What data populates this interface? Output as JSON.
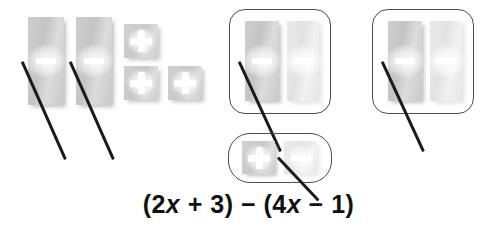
{
  "diagram": {
    "expression": {
      "full_text": "(2x + 3) − (4x − 1)",
      "open_paren_1": "(",
      "coefficient_1": "2",
      "variable_1": "x",
      "operator_1": "+",
      "constant_1": "3",
      "close_paren_1": ")",
      "operator_main": "−",
      "open_paren_2": "(",
      "coefficient_2": "4",
      "variable_2": "x",
      "operator_2": "−",
      "constant_2": "1",
      "close_paren_2": ")"
    },
    "colors": {
      "tile_fill": "#c9c9c9",
      "tile_fill_faint": "#e8e8e8",
      "sign_color": "#ffffff",
      "crossout_color": "#1b1b1b",
      "group_border": "#4d4d4d",
      "text_color": "#111111",
      "background": "#ffffff"
    },
    "loose_tiles": [
      {
        "id": "x-tile-1",
        "kind": "x-tile",
        "sign": "minus",
        "crossed_out": true,
        "faint": false,
        "x": 28,
        "y": 17,
        "w": 36,
        "h": 88
      },
      {
        "id": "x-tile-2",
        "kind": "x-tile",
        "sign": "minus",
        "crossed_out": true,
        "faint": false,
        "x": 76,
        "y": 17,
        "w": 36,
        "h": 88
      },
      {
        "id": "unit-tile-1",
        "kind": "unit-tile",
        "sign": "plus",
        "crossed_out": false,
        "faint": false,
        "x": 124,
        "y": 24,
        "w": 34,
        "h": 34
      },
      {
        "id": "unit-tile-2",
        "kind": "unit-tile",
        "sign": "plus",
        "crossed_out": false,
        "faint": false,
        "x": 124,
        "y": 66,
        "w": 34,
        "h": 34
      },
      {
        "id": "unit-tile-3",
        "kind": "unit-tile",
        "sign": "plus",
        "crossed_out": false,
        "faint": false,
        "x": 168,
        "y": 66,
        "w": 34,
        "h": 34
      }
    ],
    "groups": [
      {
        "id": "zero-pair-group-1",
        "label": "zero-pair-x-tiles-left",
        "x": 229,
        "y": 9,
        "w": 102,
        "h": 105,
        "wide": false,
        "tiles": [
          {
            "id": "g1-x-tile-a",
            "kind": "x-tile",
            "sign": "minus",
            "crossed_out": true,
            "faint": false,
            "x": 16,
            "y": 12,
            "w": 34,
            "h": 80
          },
          {
            "id": "g1-x-tile-b",
            "kind": "x-tile",
            "sign": "minus",
            "crossed_out": false,
            "faint": true,
            "x": 58,
            "y": 12,
            "w": 32,
            "h": 80
          }
        ]
      },
      {
        "id": "zero-pair-group-2",
        "label": "zero-pair-x-tiles-right",
        "x": 372,
        "y": 9,
        "w": 102,
        "h": 105,
        "wide": false,
        "tiles": [
          {
            "id": "g2-x-tile-a",
            "kind": "x-tile",
            "sign": "minus",
            "crossed_out": true,
            "faint": false,
            "x": 16,
            "y": 12,
            "w": 34,
            "h": 80
          },
          {
            "id": "g2-x-tile-b",
            "kind": "x-tile",
            "sign": "minus",
            "crossed_out": false,
            "faint": true,
            "x": 58,
            "y": 12,
            "w": 32,
            "h": 80
          }
        ]
      },
      {
        "id": "zero-pair-group-3",
        "label": "zero-pair-unit-tiles",
        "x": 228,
        "y": 133,
        "w": 104,
        "h": 50,
        "wide": true,
        "tiles": [
          {
            "id": "g3-unit-tile-a",
            "kind": "unit-tile",
            "sign": "plus",
            "crossed_out": false,
            "faint": false,
            "x": 14,
            "y": 8,
            "w": 33,
            "h": 33
          },
          {
            "id": "g3-unit-tile-b",
            "kind": "unit-tile",
            "sign": "minus",
            "crossed_out": true,
            "faint": true,
            "x": 56,
            "y": 8,
            "w": 33,
            "h": 33
          }
        ]
      }
    ],
    "expression_position": {
      "y": 190
    }
  }
}
